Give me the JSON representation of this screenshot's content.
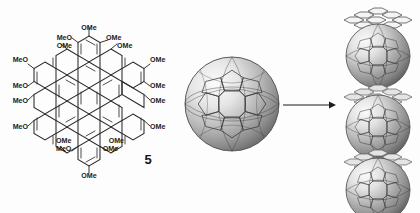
{
  "figure": {
    "background_color": "#fdfdfd",
    "ink_color": "#2b2b2b"
  },
  "compound": {
    "number": "5",
    "core_name": "hexa-peri-hexabenzocoronene",
    "substituent_count": 18,
    "labels": [
      {
        "text": "OMe",
        "x": 89,
        "y": 32,
        "anchor": "middle"
      },
      {
        "text": "MeO",
        "x": 72,
        "y": 44,
        "anchor": "end"
      },
      {
        "text": "OMe",
        "x": 72,
        "y": 52,
        "anchor": "end"
      },
      {
        "text": "OMe",
        "x": 111,
        "y": 44,
        "anchor": "start"
      },
      {
        "text": "OMe",
        "x": 121,
        "y": 52,
        "anchor": "start"
      },
      {
        "text": "MeO",
        "x": 31,
        "y": 64,
        "anchor": "end"
      },
      {
        "text": "MeO",
        "x": 31,
        "y": 90,
        "anchor": "end"
      },
      {
        "text": "MeO",
        "x": 31,
        "y": 105,
        "anchor": "end"
      },
      {
        "text": "MeO",
        "x": 31,
        "y": 131,
        "anchor": "end"
      },
      {
        "text": "OMe",
        "x": 146,
        "y": 64,
        "anchor": "start"
      },
      {
        "text": "OMe",
        "x": 146,
        "y": 90,
        "anchor": "start"
      },
      {
        "text": "OMe",
        "x": 146,
        "y": 105,
        "anchor": "start"
      },
      {
        "text": "OMe",
        "x": 146,
        "y": 131,
        "anchor": "start"
      },
      {
        "text": "OMe",
        "x": 62,
        "y": 142,
        "anchor": "start"
      },
      {
        "text": "MeO",
        "x": 62,
        "y": 150,
        "anchor": "start"
      },
      {
        "text": "OMe",
        "x": 124,
        "y": 142,
        "anchor": "end"
      },
      {
        "text": "OMe",
        "x": 116,
        "y": 150,
        "anchor": "end"
      },
      {
        "text": "OMe",
        "x": 89,
        "y": 163,
        "anchor": "middle"
      }
    ],
    "number_position": {
      "x": 148,
      "y": 161
    }
  },
  "fullerene": {
    "name": "C60",
    "center": {
      "x": 232,
      "y": 104
    },
    "radius": 47
  },
  "arrow": {
    "direction": "right",
    "x1": 283,
    "x2": 333,
    "y": 105
  },
  "assembly": {
    "description": "alternating stack of hexabenzocoronene discs and C60 spheres",
    "center_x": 378,
    "sphere_count": 3,
    "disc_count": 4,
    "spheres": [
      {
        "cx": 378,
        "cy": 56,
        "r": 32
      },
      {
        "cx": 378,
        "cy": 127,
        "r": 32
      },
      {
        "cx": 378,
        "cy": 190,
        "r": 32
      }
    ],
    "discs": [
      {
        "cx": 378,
        "cy": 16
      },
      {
        "cx": 378,
        "cy": 93
      },
      {
        "cx": 378,
        "cy": 158
      },
      {
        "cx": 378,
        "cy": 208
      }
    ]
  }
}
